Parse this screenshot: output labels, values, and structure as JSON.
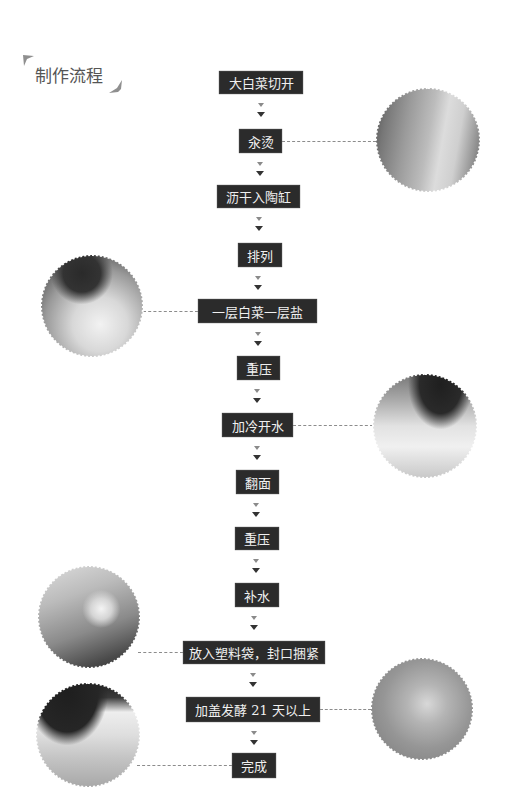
{
  "title": "制作流程",
  "colors": {
    "step_bg": "#2b2b2b",
    "step_text": "#f0f0f0",
    "arrow_light": "#8a8a8a",
    "arrow_dark": "#333333",
    "connector": "#8c8c8c",
    "title": "#555555"
  },
  "steps": [
    {
      "label": "大白菜切开"
    },
    {
      "label": "汆烫"
    },
    {
      "label": "沥干入陶缸"
    },
    {
      "label": "排列"
    },
    {
      "label": "一层白菜一层盐"
    },
    {
      "label": "重压"
    },
    {
      "label": "加冷开水"
    },
    {
      "label": "翻面"
    },
    {
      "label": "重压"
    },
    {
      "label": "补水"
    },
    {
      "label": "放入塑料袋，封口捆紧"
    },
    {
      "label": "加盖发酵 21 天以上"
    },
    {
      "label": "完成"
    }
  ],
  "photos": [
    {
      "name": "photo-blanching",
      "step_index": 1
    },
    {
      "name": "photo-layer-cabbage-salt",
      "step_index": 4
    },
    {
      "name": "photo-add-cold-water",
      "step_index": 6
    },
    {
      "name": "photo-seal-plastic-bag",
      "step_index": 10
    },
    {
      "name": "photo-ferment-covered",
      "step_index": 11
    },
    {
      "name": "photo-finished",
      "step_index": 12
    }
  ]
}
